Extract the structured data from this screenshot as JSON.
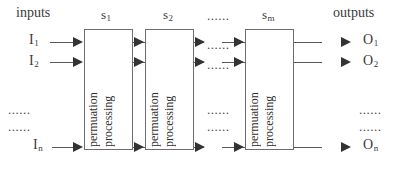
{
  "diagram": {
    "width": 408,
    "height": 178,
    "background": "#ffffff",
    "line_color": "#5a5a5a",
    "text_color": "#2f2f2f"
  },
  "headers": {
    "inputs_label": "inputs",
    "outputs_label": "outputs"
  },
  "stages": [
    {
      "id": "s1",
      "label_base": "s",
      "label_sub": "1",
      "line1": "permuation",
      "line2": "processing"
    },
    {
      "id": "s2",
      "label_base": "s",
      "label_sub": "2",
      "line1": "permuation",
      "line2": "processing"
    },
    {
      "id": "sm",
      "label_base": "s",
      "label_sub": "m",
      "line1": "permuation",
      "line2": "processing"
    }
  ],
  "stage_gap_label": "......",
  "inputs": [
    {
      "base": "I",
      "sub": "1"
    },
    {
      "base": "I",
      "sub": "2"
    },
    {
      "base": "I",
      "sub": "n"
    }
  ],
  "outputs": [
    {
      "base": "O",
      "sub": "1"
    },
    {
      "base": "O",
      "sub": "2"
    },
    {
      "base": "O",
      "sub": "n"
    }
  ],
  "vertical_ellipsis": {
    "row1": "......",
    "row2": "......"
  }
}
